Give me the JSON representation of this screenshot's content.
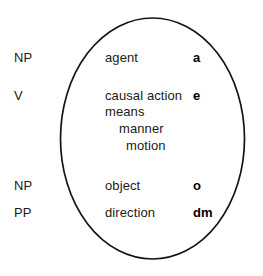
{
  "diagram": {
    "shape": "ellipse",
    "stroke_color": "#151515",
    "background_color": "#ffffff",
    "rows": [
      {
        "category": "NP",
        "slot": "agent",
        "variable": "a",
        "category_x": 14,
        "category_y": 50,
        "slot_x": 105,
        "slot_y": 50,
        "var_x": 193,
        "var_y": 50
      },
      {
        "category": "V",
        "slot": "causal action",
        "variable": "e",
        "category_x": 14,
        "category_y": 88,
        "slot_x": 105,
        "slot_y": 88,
        "var_x": 193,
        "var_y": 88
      },
      {
        "category": "NP",
        "slot": "object",
        "variable": "o",
        "category_x": 14,
        "category_y": 178,
        "slot_x": 105,
        "slot_y": 178,
        "var_x": 193,
        "var_y": 178
      },
      {
        "category": "PP",
        "slot": "direction",
        "variable": "dm",
        "category_x": 14,
        "category_y": 205,
        "slot_x": 105,
        "slot_y": 205,
        "var_x": 193,
        "var_y": 205
      }
    ],
    "verb_sub_slots": [
      {
        "label": "means",
        "x": 105,
        "y": 104
      },
      {
        "label": "manner",
        "x": 119,
        "y": 121
      },
      {
        "label": "motion",
        "x": 126,
        "y": 138
      }
    ]
  }
}
